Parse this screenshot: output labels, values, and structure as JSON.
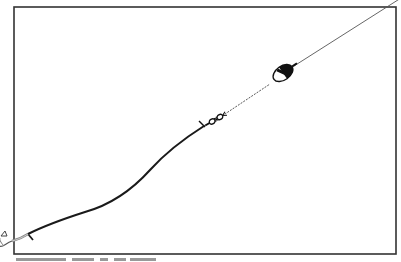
{
  "diagram": {
    "components": [
      {
        "name": "hook",
        "position": [
          8,
          235
        ]
      },
      {
        "name": "leader",
        "description": "thick line from hook to swivel"
      },
      {
        "name": "swivel",
        "position": [
          214,
          120
        ]
      },
      {
        "name": "float-weight",
        "position": [
          282,
          74
        ]
      },
      {
        "name": "main-line",
        "description": "thin line continuing to top-right corner"
      }
    ],
    "frame": {
      "left": 14,
      "top": 7,
      "right": 396,
      "bottom": 254
    },
    "colors": {
      "stroke": "#222222",
      "frame": "#333333",
      "background": "#ffffff"
    }
  },
  "caption": {
    "text": ""
  }
}
